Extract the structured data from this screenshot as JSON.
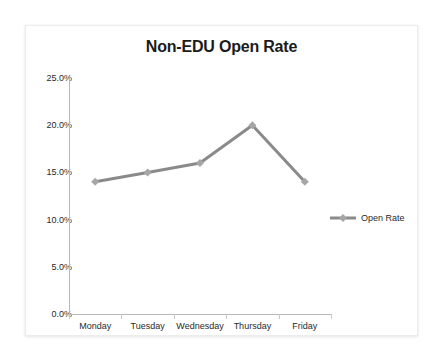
{
  "card": {
    "background": "#ffffff",
    "border_color": "#ececec"
  },
  "chart_data": {
    "type": "line",
    "title": "Non-EDU Open Rate",
    "xlabel": "",
    "ylabel": "",
    "categories": [
      "Monday",
      "Tuesday",
      "Wednesday",
      "Thursday",
      "Friday"
    ],
    "series": [
      {
        "name": "Open Rate",
        "values": [
          14.0,
          15.0,
          16.0,
          20.0,
          14.0
        ],
        "color": "#8a8a8a",
        "marker": "diamond",
        "marker_color": "#a6a6a6"
      }
    ],
    "ylim": [
      0.0,
      25.0
    ],
    "ytick_values": [
      25.0,
      20.0,
      15.0,
      10.0,
      5.0,
      0.0
    ],
    "ytick_labels": [
      "25.0%",
      "20.0%",
      "15.0%",
      "10.0%",
      "5.0%",
      "0.0%"
    ],
    "grid": false,
    "legend_position": "right",
    "legend_entries": [
      "Open Rate"
    ],
    "axis_color": "#b8b8b8",
    "text_color": "#2a2a2a"
  }
}
